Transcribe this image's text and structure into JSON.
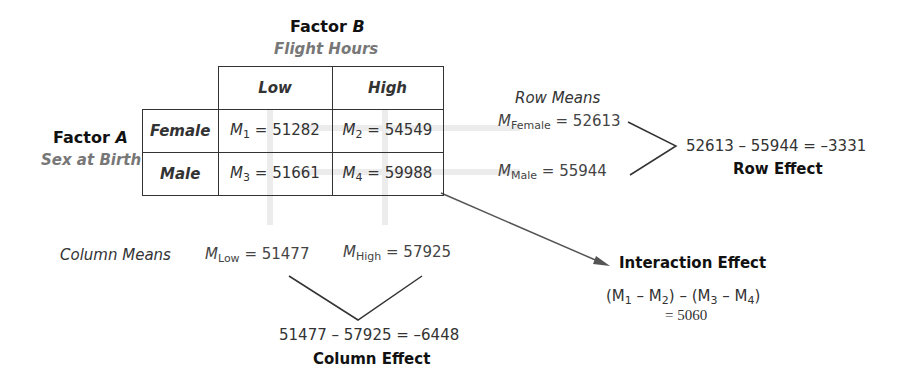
{
  "factor_b": {
    "title": "Factor B",
    "title_prefix": "Factor ",
    "title_letter": "B",
    "subtitle": "Flight Hours"
  },
  "factor_a": {
    "title_prefix": "Factor ",
    "title_letter": "A",
    "subtitle": "Sex at Birth"
  },
  "table": {
    "columns": [
      "Low",
      "High"
    ],
    "rows": [
      {
        "label": "Female",
        "cells": [
          {
            "sym": "M",
            "sub": "1",
            "value": "= 51282"
          },
          {
            "sym": "M",
            "sub": "2",
            "value": "= 54549"
          }
        ]
      },
      {
        "label": "Male",
        "cells": [
          {
            "sym": "M",
            "sub": "3",
            "value": "= 51661"
          },
          {
            "sym": "M",
            "sub": "4",
            "value": "= 59988"
          }
        ]
      }
    ]
  },
  "row_means": {
    "title": "Row Means",
    "female": {
      "sym": "M",
      "sub": "Female",
      "value": "= 52613"
    },
    "male": {
      "sym": "M",
      "sub": "Male",
      "value": "= 55944"
    },
    "equation": "52613 – 55944 = –3331",
    "effect_label": "Row Effect"
  },
  "column_means": {
    "title": "Column Means",
    "low": {
      "sym": "M",
      "sub": "Low",
      "value": "= 51477"
    },
    "high": {
      "sym": "M",
      "sub": "High",
      "value": "= 57925"
    },
    "equation": "51477 – 57925 = –6448",
    "effect_label": "Column Effect"
  },
  "interaction": {
    "title": "Interaction Effect",
    "formula_parts": [
      "(M",
      "1",
      " – M",
      "2",
      ") – (M",
      "3",
      " – M",
      "4",
      ")"
    ],
    "result": "= 5060"
  },
  "colors": {
    "line": "#333333",
    "ghost": "#e6e6e6",
    "text": "#333333",
    "subtitle": "#666666"
  }
}
